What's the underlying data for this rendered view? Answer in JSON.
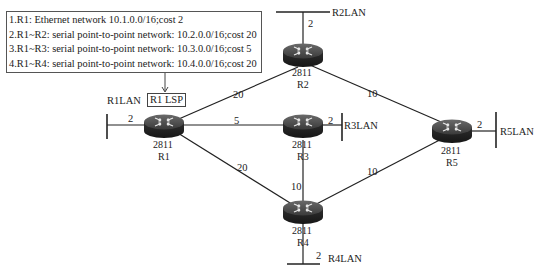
{
  "lsp_table": {
    "lines": [
      "1.R1: Ethernet network 10.1.0.0/16;cost 2",
      "2.R1~R2: serial point-to-point network: 10.2.0.0/16;cost 20",
      "3.R1~R3: serial point-to-point network: 10.3.0.0/16;cost 5",
      "4.R1~R4: serial point-to-point network: 10.4.0.0/16;cost 20"
    ]
  },
  "r1_lsp_label": "R1 LSP",
  "routers": [
    {
      "id": "R1",
      "model": "2811",
      "name": "R1",
      "icon": "router-icon"
    },
    {
      "id": "R2",
      "model": "2811",
      "name": "R2",
      "icon": "router-icon"
    },
    {
      "id": "R3",
      "model": "2811",
      "name": "R3",
      "icon": "router-icon"
    },
    {
      "id": "R4",
      "model": "2811",
      "name": "R4",
      "icon": "router-icon"
    },
    {
      "id": "R5",
      "model": "2811",
      "name": "R5",
      "icon": "router-icon"
    }
  ],
  "lans": [
    {
      "name": "R1LAN",
      "cost": "2"
    },
    {
      "name": "R2LAN",
      "cost": "2"
    },
    {
      "name": "R3LAN",
      "cost": "2"
    },
    {
      "name": "R4LAN",
      "cost": "2"
    },
    {
      "name": "R5LAN",
      "cost": "2"
    }
  ],
  "links": [
    {
      "from": "R1",
      "to": "R2",
      "cost": "20"
    },
    {
      "from": "R1",
      "to": "R3",
      "cost": "5"
    },
    {
      "from": "R1",
      "to": "R4",
      "cost": "20"
    },
    {
      "from": "R2",
      "to": "R5",
      "cost": "10"
    },
    {
      "from": "R3",
      "to": "R4",
      "cost": "10"
    },
    {
      "from": "R4",
      "to": "R5",
      "cost": "10"
    }
  ]
}
